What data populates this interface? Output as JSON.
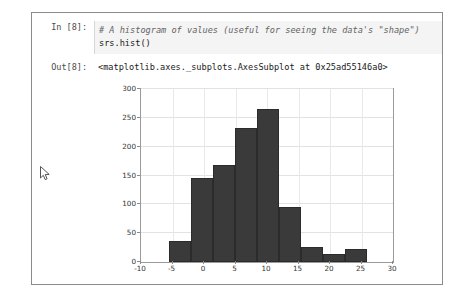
{
  "cell": {
    "in_prompt": "In [8]:",
    "out_prompt": "Out[8]:",
    "code_comment": "# A histogram of values (useful for seeing the data's \"shape\")",
    "code_statement": "srs.hist()",
    "output_text": "<matplotlib.axes._subplots.AxesSubplot at 0x25ad55146a0>"
  },
  "colors": {
    "bar_fill": "#3a3a3a",
    "cell_border": "#8b8b8b",
    "input_background": "#f4f4f4",
    "comment_text": "#656565",
    "grid": "#e2e2e2"
  },
  "cursor": {
    "name": "mouse-pointer"
  },
  "chart_data": {
    "type": "bar",
    "title": "",
    "xlabel": "",
    "ylabel": "",
    "xlim": [
      -10,
      30
    ],
    "ylim": [
      0,
      300
    ],
    "grid": true,
    "legend": null,
    "xticks": [
      -10,
      -5,
      0,
      5,
      10,
      15,
      20,
      25,
      30
    ],
    "yticks": [
      0,
      50,
      100,
      150,
      200,
      250,
      300
    ],
    "bin_edges": [
      -5.6,
      -2.1,
      1.4,
      4.9,
      8.4,
      11.9,
      15.4,
      18.9,
      22.4,
      25.9,
      29.4
    ],
    "values": [
      36,
      145,
      168,
      233,
      265,
      96,
      26,
      14,
      22,
      0
    ],
    "categories": [
      "-5.6..-2.1",
      "-2.1..1.4",
      "1.4..4.9",
      "4.9..8.4",
      "8.4..11.9",
      "11.9..15.4",
      "15.4..18.9",
      "18.9..22.4",
      "22.4..25.9",
      "25.9..29.4"
    ]
  }
}
